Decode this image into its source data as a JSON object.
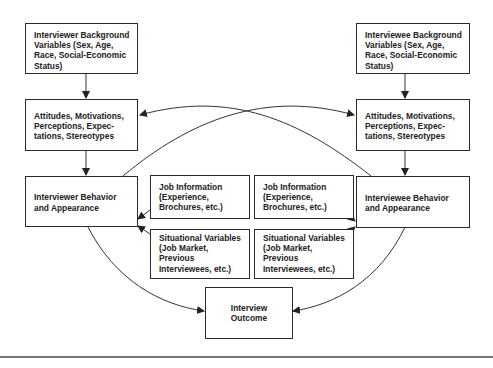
{
  "diagram": {
    "type": "flow-model",
    "nodes": {
      "interviewer_background": "Interviewer Background Variables (Sex, Age, Race, Social-Economic Status)",
      "interviewer_attitudes": "Attitudes, Motivations, Perceptions, Expec- tations, Stereotypes",
      "interviewer_behavior": "Interviewer Behavior and Appearance",
      "job_info_left": "Job Information (Experience, Brochures, etc.)",
      "situational_left": "Situational Variables (Job Market, Previous Interviewees, etc.)",
      "job_info_right": "Job Information (Experience, Brochures, etc.)",
      "situational_right": "Situational Variables (Job Market, Previous Interviewees, etc.)",
      "interviewee_background": "Interviewee Background Variables (Sex, Age, Race, Social-Economic Status)",
      "interviewee_attitudes": "Attitudes, Motivations, Perceptions, Expec- tations, Stereotypes",
      "interviewee_behavior": "Interviewee Behavior and Appearance",
      "outcome": "Interview Outcome"
    },
    "edges": [
      [
        "interviewer_background",
        "interviewer_attitudes"
      ],
      [
        "interviewer_attitudes",
        "interviewer_behavior"
      ],
      [
        "interviewee_background",
        "interviewee_attitudes"
      ],
      [
        "interviewee_attitudes",
        "interviewee_behavior"
      ],
      [
        "interviewer_behavior",
        "interviewee_attitudes"
      ],
      [
        "interviewee_behavior",
        "interviewer_attitudes"
      ],
      [
        "job_info_left",
        "interviewer_behavior"
      ],
      [
        "situational_left",
        "interviewer_behavior"
      ],
      [
        "job_info_right",
        "interviewee_behavior"
      ],
      [
        "situational_right",
        "interviewee_behavior"
      ],
      [
        "interviewer_behavior",
        "outcome"
      ],
      [
        "interviewee_behavior",
        "outcome"
      ]
    ]
  }
}
